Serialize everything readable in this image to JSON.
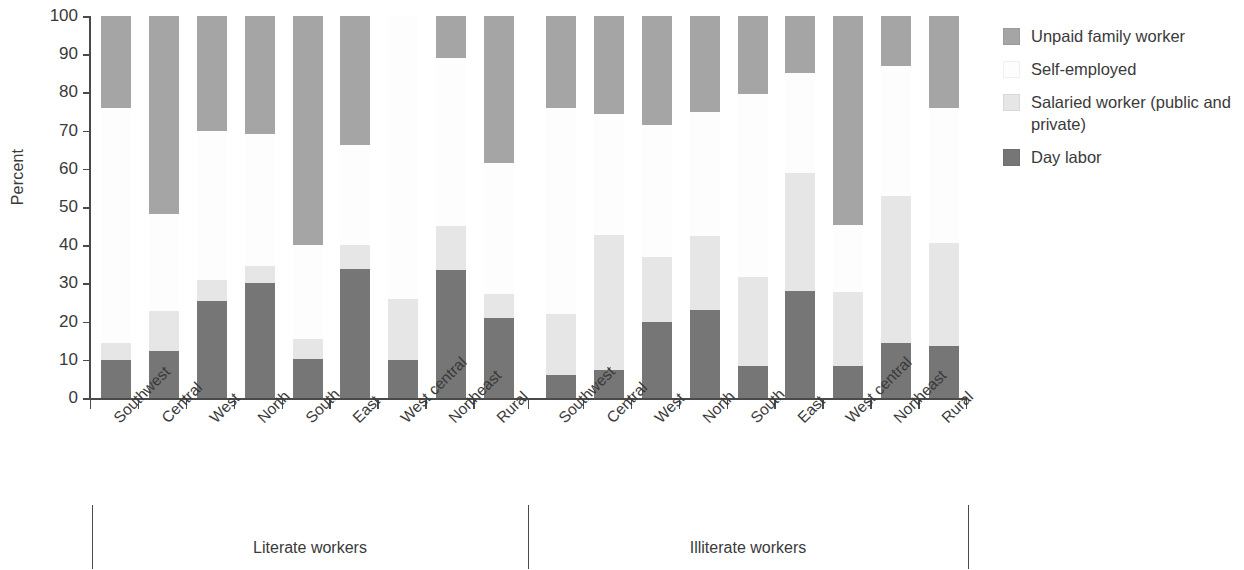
{
  "chart_data": {
    "type": "bar",
    "subtype": "stacked-bar-grouped",
    "title": "",
    "xlabel": "",
    "ylabel": "Percent",
    "ylim": [
      0,
      100
    ],
    "yticks": [
      0,
      10,
      20,
      30,
      40,
      50,
      60,
      70,
      80,
      90,
      100
    ],
    "grid": false,
    "legend_position": "right",
    "stack_order_bottom_to_top": [
      "Day labor",
      "Salaried worker (public and private)",
      "Self-employed",
      "Unpaid family worker"
    ],
    "groups": [
      "Literate workers",
      "Illiterate workers"
    ],
    "categories": [
      "Southwest",
      "Central",
      "West",
      "North",
      "South",
      "East",
      "West central",
      "Northeast",
      "Rural"
    ],
    "series": [
      {
        "name": "Day labor",
        "color": "#767676",
        "values_literate": [
          10.0,
          12.3,
          25.5,
          30.2,
          10.2,
          33.8,
          10.0,
          33.5,
          21.0
        ],
        "values_illiterate": [
          6.0,
          7.3,
          20.0,
          23.0,
          8.3,
          28.0,
          8.5,
          14.5,
          13.5
        ]
      },
      {
        "name": "Salaried worker (public and private)",
        "color": "#e6e6e6",
        "values_literate": [
          4.5,
          10.5,
          5.5,
          4.3,
          5.3,
          6.2,
          15.8,
          11.5,
          6.3
        ],
        "values_illiterate": [
          16.0,
          35.5,
          16.8,
          19.3,
          23.3,
          31.0,
          19.3,
          38.3,
          27.0
        ]
      },
      {
        "name": "Self-employed",
        "color": "#fdfdfd",
        "values_literate": [
          61.5,
          25.5,
          39.0,
          34.7,
          24.5,
          26.3,
          74.2,
          44.0,
          34.2
        ],
        "values_illiterate": [
          54.0,
          31.5,
          34.7,
          32.7,
          48.0,
          26.0,
          17.5,
          34.0,
          35.5
        ]
      },
      {
        "name": "Unpaid family worker",
        "color": "#a5a5a5",
        "values_literate": [
          24.0,
          51.7,
          30.0,
          30.8,
          60.0,
          33.7,
          0.0,
          11.0,
          38.5
        ],
        "values_illiterate": [
          24.0,
          25.7,
          28.5,
          25.0,
          20.4,
          15.0,
          54.7,
          13.2,
          24.0
        ]
      }
    ],
    "stack_tops_literate": {
      "day_labor": [
        10.0,
        12.3,
        25.5,
        30.2,
        10.2,
        33.8,
        10.0,
        33.5,
        21.0
      ],
      "plus_salaried": [
        14.5,
        22.8,
        31.0,
        34.5,
        15.5,
        40.0,
        25.8,
        45.0,
        27.3
      ],
      "plus_self": [
        76.0,
        48.3,
        70.0,
        69.2,
        40.0,
        66.3,
        100.0,
        89.0,
        61.5
      ],
      "plus_unpaid": [
        100.0,
        100.0,
        100.0,
        100.0,
        100.0,
        100.0,
        100.0,
        100.0,
        100.0
      ]
    },
    "stack_tops_illiterate": {
      "day_labor": [
        6.0,
        7.3,
        20.0,
        23.0,
        8.3,
        28.0,
        8.5,
        14.5,
        13.5
      ],
      "plus_salaried": [
        22.0,
        42.8,
        36.8,
        42.3,
        31.6,
        59.0,
        27.8,
        52.8,
        40.5
      ],
      "plus_self": [
        76.0,
        74.3,
        71.5,
        75.0,
        79.6,
        85.0,
        45.3,
        86.8,
        76.0
      ],
      "plus_unpaid": [
        100.0,
        100.0,
        100.0,
        100.0,
        100.0,
        100.0,
        100.0,
        100.0,
        99.2
      ]
    }
  },
  "axis": {
    "y_title": "Percent",
    "y_tick_labels": [
      "100",
      "90",
      "80",
      "70",
      "60",
      "50",
      "40",
      "30",
      "20",
      "10",
      "0"
    ]
  },
  "groups": [
    {
      "label": "Literate workers"
    },
    {
      "label": "Illiterate workers"
    }
  ],
  "categories": [
    "Southwest",
    "Central",
    "West",
    "North",
    "South",
    "East",
    "West central",
    "Northeast",
    "Rural"
  ],
  "legend": {
    "items": [
      {
        "label": "Unpaid family worker",
        "color": "#a5a5a5",
        "icon": "legend-swatch-icon"
      },
      {
        "label": "Self-employed",
        "color": "#fdfdfd",
        "icon": "legend-swatch-icon"
      },
      {
        "label": "Salaried worker (public and private)",
        "color": "#e6e6e6",
        "icon": "legend-swatch-icon"
      },
      {
        "label": "Day labor",
        "color": "#767676",
        "icon": "legend-swatch-icon"
      }
    ]
  }
}
